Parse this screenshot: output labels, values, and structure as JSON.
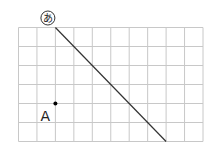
{
  "grid": {
    "cols": 10,
    "rows": 6,
    "x0": 18.5,
    "y0": 27.5,
    "cell_w": 18.45,
    "cell_h": 19,
    "line_color": "#c8c8c8"
  },
  "line": {
    "label": "あ",
    "from": [
      2,
      0
    ],
    "to": [
      8,
      6
    ],
    "color": "#333333"
  },
  "point": {
    "label": "A",
    "at": [
      2,
      4
    ],
    "color": "#000000"
  }
}
